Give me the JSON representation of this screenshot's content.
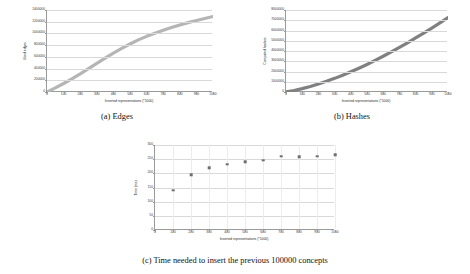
{
  "figure": {
    "captions": {
      "a": "(a) Edges",
      "b": "(b) Hashes",
      "c": "(c) Time needed to insert the previous 100000 concepts"
    }
  },
  "chart_data": [
    {
      "id": "a",
      "type": "line",
      "title": "",
      "xlabel": "Inserted representations (*1000)",
      "ylabel": "Used edges",
      "xlim": [
        0,
        1000
      ],
      "ylim": [
        0,
        1400000
      ],
      "xticks": [
        "0",
        "100",
        "200",
        "300",
        "400",
        "500",
        "600",
        "700",
        "800",
        "900",
        "1000"
      ],
      "yticks": [
        "0",
        "200000",
        "400000",
        "600000",
        "800000",
        "1000000",
        "1200000",
        "1400000"
      ],
      "grid": true,
      "legend": "none",
      "color": "#b5b5b5",
      "x": [
        0,
        50,
        100,
        150,
        200,
        250,
        300,
        350,
        400,
        450,
        500,
        550,
        600,
        650,
        700,
        750,
        800,
        850,
        900,
        950,
        1000
      ],
      "y": [
        0,
        70000,
        145000,
        225000,
        310000,
        400000,
        490000,
        580000,
        665000,
        745000,
        820000,
        890000,
        950000,
        1005000,
        1055000,
        1100000,
        1145000,
        1185000,
        1220000,
        1255000,
        1290000
      ]
    },
    {
      "id": "b",
      "type": "line",
      "title": "",
      "xlabel": "Inserted representations (*1000)",
      "ylabel": "Computed hashes",
      "xlim": [
        0,
        1000
      ],
      "ylim": [
        0,
        8000000
      ],
      "xticks": [
        "0",
        "100",
        "200",
        "300",
        "400",
        "500",
        "600",
        "700",
        "800",
        "900",
        "1000"
      ],
      "yticks": [
        "0",
        "1000000",
        "2000000",
        "3000000",
        "4000000",
        "5000000",
        "6000000",
        "7000000",
        "8000000"
      ],
      "grid": true,
      "legend": "none",
      "color": "#808080",
      "x": [
        0,
        50,
        100,
        150,
        200,
        250,
        300,
        350,
        400,
        450,
        500,
        550,
        600,
        650,
        700,
        750,
        800,
        850,
        900,
        950,
        1000
      ],
      "y": [
        0,
        150000,
        330000,
        540000,
        780000,
        1040000,
        1330000,
        1640000,
        1970000,
        2320000,
        2690000,
        3080000,
        3490000,
        3910000,
        4350000,
        4800000,
        5270000,
        5750000,
        6240000,
        6740000,
        7250000
      ]
    },
    {
      "id": "c",
      "type": "scatter",
      "title": "",
      "xlabel": "Inserted representations (*1000)",
      "ylabel": "Time (ms)",
      "xlim": [
        0,
        1000
      ],
      "ylim": [
        0,
        300
      ],
      "xticks": [
        "0",
        "100",
        "200",
        "300",
        "400",
        "500",
        "600",
        "700",
        "800",
        "900",
        "1000"
      ],
      "yticks": [
        "0",
        "50",
        "100",
        "150",
        "200",
        "250",
        "300"
      ],
      "grid": true,
      "legend": "none",
      "color": "#6e6e6e",
      "x": [
        100,
        200,
        300,
        400,
        500,
        600,
        700,
        800,
        900,
        1000
      ],
      "y": [
        136,
        192,
        217,
        229,
        237,
        243,
        256,
        255,
        257,
        262
      ]
    }
  ]
}
